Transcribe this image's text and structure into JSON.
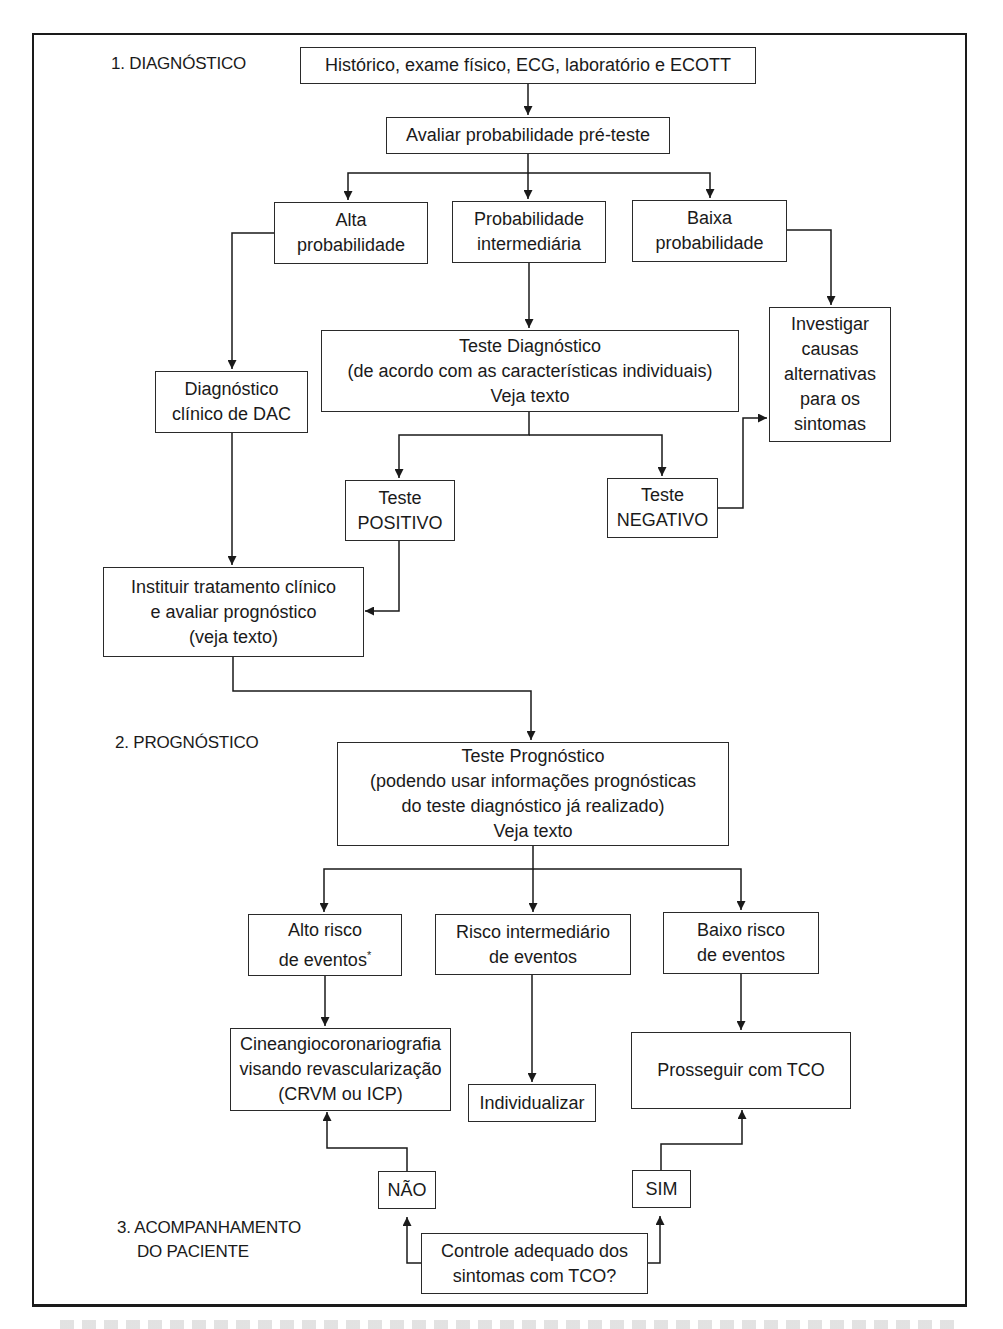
{
  "sections": {
    "diagnostico": "1. DIAGNÓSTICO",
    "prognostico": "2. PROGNÓSTICO",
    "acompanhamento_line1": "3. ACOMPANHAMENTO",
    "acompanhamento_line2": "DO PACIENTE"
  },
  "nodes": {
    "historico": [
      "Histórico, exame físico, ECG, laboratório e ECOTT"
    ],
    "avaliar": [
      "Avaliar probabilidade pré-teste"
    ],
    "alta_prob": [
      "Alta",
      "probabilidade"
    ],
    "inter_prob": [
      "Probabilidade",
      "intermediária"
    ],
    "baixa_prob": [
      "Baixa",
      "probabilidade"
    ],
    "investigar": [
      "Investigar",
      "causas",
      "alternativas",
      "para os",
      "sintomas"
    ],
    "teste_diag": [
      "Teste Diagnóstico",
      "(de acordo com as características individuais)",
      "Veja texto"
    ],
    "diag_clinico": [
      "Diagnóstico",
      "clínico de DAC"
    ],
    "teste_pos": [
      "Teste",
      "POSITIVO"
    ],
    "teste_neg": [
      "Teste",
      "NEGATIVO"
    ],
    "instituir": [
      "Instituir tratamento clínico",
      "e avaliar prognóstico",
      "(veja texto)"
    ],
    "teste_prog": [
      "Teste Prognóstico",
      "(podendo usar informações prognósticas",
      "do teste diagnóstico já realizado)",
      "Veja texto"
    ],
    "alto_risco": [
      "Alto risco",
      "de eventos"
    ],
    "alto_risco_mark": "*",
    "inter_risco": [
      "Risco intermediário",
      "de eventos"
    ],
    "baixo_risco": [
      "Baixo risco",
      "de eventos"
    ],
    "cineangio": [
      "Cineangiocoronariografia",
      "visando revascularização",
      "(CRVM ou ICP)"
    ],
    "individualizar": [
      "Individualizar"
    ],
    "prosseguir": [
      "Prosseguir com TCO"
    ],
    "nao": [
      "NÃO"
    ],
    "sim": [
      "SIM"
    ],
    "controle": [
      "Controle adequado dos",
      "sintomas com TCO?"
    ]
  },
  "colors": {
    "line": "#1a1a1a",
    "background": "#ffffff"
  }
}
